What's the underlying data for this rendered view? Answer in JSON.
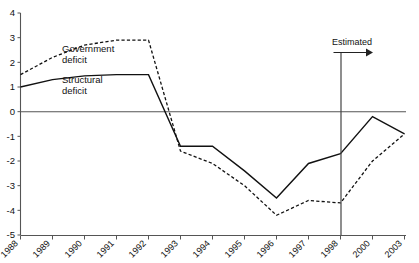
{
  "chart_data": {
    "type": "line",
    "title": "",
    "xlabel": "",
    "ylabel": "",
    "ylim": [
      -5,
      4
    ],
    "yticks": [
      4,
      3,
      2,
      1,
      0,
      -1,
      -2,
      -3,
      -4,
      -5
    ],
    "ytick_labels": [
      "4",
      "3",
      "2",
      "1",
      "0",
      "-1",
      "-2",
      "-3",
      "-4",
      "-5"
    ],
    "grid": false,
    "legend_position": "inline-annotation",
    "categories": [
      "1988",
      "1989",
      "1990",
      "1991",
      "1992",
      "1993",
      "1994",
      "1995",
      "1996",
      "1997",
      "1998",
      "2000",
      "2003"
    ],
    "series": [
      {
        "name": "Government deficit",
        "style": "dashed",
        "values": [
          1.5,
          2.2,
          2.7,
          2.9,
          2.9,
          -1.6,
          -2.1,
          -3.0,
          -4.2,
          -3.6,
          -3.7,
          -2.0,
          -0.9
        ]
      },
      {
        "name": "Structural deficit",
        "style": "solid",
        "values": [
          1.0,
          1.3,
          1.45,
          1.5,
          1.5,
          -1.4,
          -1.4,
          -2.4,
          -3.5,
          -2.1,
          -1.7,
          -0.2,
          -0.9
        ]
      }
    ],
    "annotations": [
      {
        "id": "government-deficit",
        "text_line1": "Government",
        "text_line2": "deficit"
      },
      {
        "id": "structural-deficit",
        "text_line1": "Structural",
        "text_line2": "deficit"
      },
      {
        "id": "estimated-marker",
        "text": "Estimated",
        "at_category": "1998",
        "marker": "vertical-line-with-right-arrow"
      }
    ],
    "colors": {
      "axis": "#555555",
      "series": "#111111",
      "text": "#111111",
      "background": "#ffffff"
    }
  }
}
